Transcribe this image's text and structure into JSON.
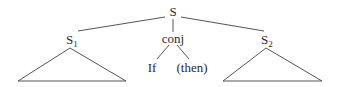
{
  "tree": {
    "root": {
      "label": "S"
    },
    "left": {
      "label": "S",
      "subscript": "1"
    },
    "middle": {
      "label": "conj",
      "children": [
        "If",
        "(then)"
      ]
    },
    "right": {
      "label": "S",
      "subscript": "2"
    }
  },
  "colors": {
    "ink": "#2a2a2a",
    "line": "#555555",
    "background": "#ffffff"
  }
}
